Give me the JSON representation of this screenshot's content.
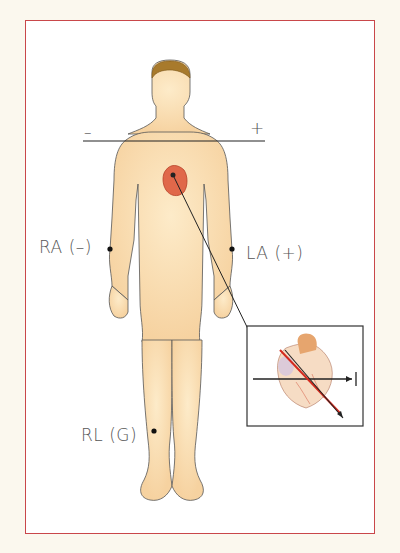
{
  "diagram": {
    "lead_line": {
      "negative_sign": "–",
      "positive_sign": "+"
    },
    "electrodes": [
      {
        "id": "RA",
        "label": "RA (–)"
      },
      {
        "id": "LA",
        "label": "LA (+)"
      },
      {
        "id": "RL",
        "label": "RL (G)"
      }
    ],
    "inset": {
      "lead_label": "I"
    },
    "colors": {
      "frame_border": "#c9474a",
      "background": "#fbf8ee",
      "skin": "#f9dcb0",
      "hair": "#a87a2c",
      "heart": "#e0684a",
      "axis_red": "#d42a1e",
      "line": "#222222"
    }
  }
}
